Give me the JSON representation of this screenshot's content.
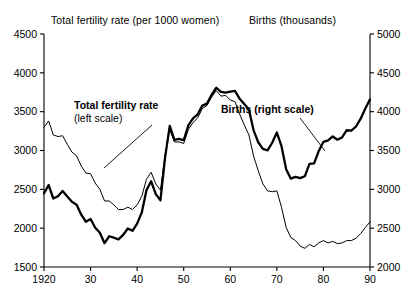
{
  "header": {
    "left_title": "Total fertility rate (per 1000 women)",
    "right_title": "Births (thousands)"
  },
  "annotations": {
    "fertility_bold": "Total fertility rate",
    "fertility_sub": "(left scale)",
    "births_bold": "Births",
    "births_sub": " (right scale)"
  },
  "colors": {
    "axis": "#000000",
    "line": "#000000",
    "background": "#ffffff"
  },
  "chart_data": {
    "type": "line",
    "title": "",
    "xlabel": "",
    "ylabel": "Total fertility rate (per 1000 women)",
    "y2label": "Births (thousands)",
    "xlim": [
      1920,
      1990
    ],
    "ylim": [
      1500,
      4500
    ],
    "y2lim": [
      2000,
      5000
    ],
    "grid": false,
    "legend": "inline-annotations",
    "xticks": [
      1920,
      1930,
      1940,
      1950,
      1960,
      1970,
      1980,
      1990
    ],
    "xticklabels": [
      "1920",
      "30",
      "40",
      "50",
      "60",
      "70",
      "80",
      "90"
    ],
    "yticks": [
      1500,
      2000,
      2500,
      3000,
      3500,
      4000,
      4500
    ],
    "yticklabels": [
      "1500",
      "2000",
      "2500",
      "3000",
      "3500",
      "4000",
      "4500"
    ],
    "y2ticks": [
      2000,
      2500,
      3000,
      3500,
      4000,
      4500,
      5000
    ],
    "y2ticklabels": [
      "2000",
      "2500",
      "3000",
      "3500",
      "4000",
      "4500",
      "5000"
    ],
    "x": [
      1920,
      1921,
      1922,
      1923,
      1924,
      1925,
      1926,
      1927,
      1928,
      1929,
      1930,
      1931,
      1932,
      1933,
      1934,
      1935,
      1936,
      1937,
      1938,
      1939,
      1940,
      1941,
      1942,
      1943,
      1944,
      1945,
      1946,
      1947,
      1948,
      1949,
      1950,
      1951,
      1952,
      1953,
      1954,
      1955,
      1956,
      1957,
      1958,
      1959,
      1960,
      1961,
      1962,
      1963,
      1964,
      1965,
      1966,
      1967,
      1968,
      1969,
      1970,
      1971,
      1972,
      1973,
      1974,
      1975,
      1976,
      1977,
      1978,
      1979,
      1980,
      1981,
      1982,
      1983,
      1984,
      1985,
      1986,
      1987,
      1988,
      1989,
      1990
    ],
    "series": [
      {
        "name": "Total fertility rate",
        "axis": "left",
        "style": "thin",
        "units": "per 1000 women",
        "values": [
          3300,
          3380,
          3200,
          3180,
          3190,
          3080,
          2980,
          2930,
          2800,
          2710,
          2700,
          2580,
          2500,
          2350,
          2350,
          2300,
          2240,
          2240,
          2270,
          2240,
          2300,
          2410,
          2630,
          2720,
          2570,
          2490,
          2940,
          3270,
          3110,
          3110,
          3090,
          3270,
          3360,
          3420,
          3540,
          3580,
          3690,
          3770,
          3700,
          3710,
          3650,
          3630,
          3470,
          3330,
          3200,
          2930,
          2740,
          2570,
          2480,
          2470,
          2480,
          2270,
          2010,
          1880,
          1840,
          1770,
          1740,
          1790,
          1760,
          1810,
          1840,
          1810,
          1830,
          1800,
          1810,
          1840,
          1840,
          1870,
          1930,
          2010,
          2080
        ]
      },
      {
        "name": "Births",
        "axis": "right",
        "style": "thick",
        "units": "thousands",
        "values": [
          2950,
          3055,
          2882,
          2910,
          2979,
          2909,
          2839,
          2802,
          2674,
          2582,
          2618,
          2506,
          2440,
          2307,
          2396,
          2377,
          2355,
          2413,
          2496,
          2466,
          2559,
          2703,
          2989,
          3104,
          2939,
          2858,
          3411,
          3817,
          3637,
          3649,
          3632,
          3823,
          3913,
          3965,
          4078,
          4104,
          4218,
          4308,
          4255,
          4244,
          4258,
          4268,
          4167,
          4098,
          4027,
          3760,
          3606,
          3521,
          3502,
          3600,
          3731,
          3556,
          3258,
          3137,
          3160,
          3144,
          3168,
          3327,
          3333,
          3494,
          3612,
          3629,
          3681,
          3639,
          3669,
          3761,
          3757,
          3809,
          3910,
          4041,
          4158
        ]
      }
    ]
  }
}
